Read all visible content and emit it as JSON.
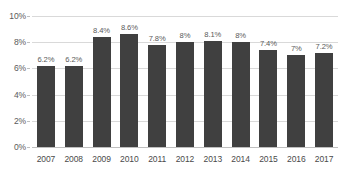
{
  "chart_data": {
    "type": "bar",
    "title": "",
    "subtitle": "",
    "xlabel": "",
    "ylabel": "",
    "categories": [
      "2007",
      "2008",
      "2009",
      "2010",
      "2011",
      "2012",
      "2013",
      "2014",
      "2015",
      "2016",
      "2017"
    ],
    "values": [
      6.2,
      6.2,
      8.4,
      8.6,
      7.8,
      8.0,
      8.1,
      8.0,
      7.4,
      7.0,
      7.2
    ],
    "data_labels": [
      "6.2%",
      "6.2%",
      "8.4%",
      "8.6%",
      "7.8%",
      "8%",
      "8.1%",
      "8%",
      "7.4%",
      "7%",
      "7.2%"
    ],
    "ylim": [
      0,
      10
    ],
    "ytick_values": [
      0,
      2,
      4,
      6,
      8,
      10
    ],
    "ytick_labels": [
      "0%",
      "2%",
      "4%",
      "6%",
      "8%",
      "10%"
    ],
    "grid": true,
    "legend": null,
    "series_color": "#404040",
    "gridline_color": "#d9d9d9",
    "label_color": "#5a5a5a"
  }
}
